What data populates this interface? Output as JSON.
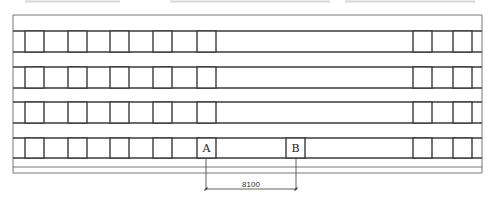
{
  "drawing": {
    "type": "structural-plan",
    "frame": {
      "x1": 13,
      "y1": 15,
      "x2": 482,
      "y2": 173
    },
    "beam_rows": [
      {
        "top": 31,
        "bottom": 52
      },
      {
        "top": 67,
        "bottom": 88
      },
      {
        "top": 102,
        "bottom": 123
      },
      {
        "top": 138,
        "bottom": 158
      }
    ],
    "bottom_lines": [
      167,
      173
    ],
    "column_xs_left": [
      25,
      68,
      110,
      153,
      197
    ],
    "column_xs_right": [
      413,
      453
    ],
    "column_size": 19,
    "markers": [
      {
        "id": "A",
        "label": "A",
        "x": 197
      },
      {
        "id": "B",
        "label": "B",
        "x": 286
      }
    ],
    "dimension": {
      "label": "8100",
      "x1": 206,
      "x2": 296,
      "y": 189
    },
    "colors": {
      "line": "#3a3a3a",
      "thin_line": "#777777",
      "faint": "#d8d8d8"
    }
  }
}
